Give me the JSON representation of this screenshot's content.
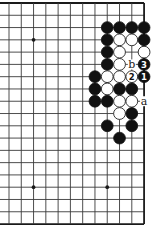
{
  "diagram": {
    "type": "go-board-fragment",
    "board_size": 19,
    "visible_columns": 12,
    "visible_rows": 19,
    "edges_visible": [
      "top",
      "right",
      "bottom"
    ],
    "star_points": [
      {
        "col": 2,
        "row": 3
      },
      {
        "col": 2,
        "row": 15
      },
      {
        "col": 8,
        "row": 15
      }
    ],
    "stones": [
      {
        "color": "black",
        "col": 8,
        "row": 2
      },
      {
        "color": "black",
        "col": 9,
        "row": 2
      },
      {
        "color": "black",
        "col": 10,
        "row": 2
      },
      {
        "color": "black",
        "col": 11,
        "row": 2
      },
      {
        "color": "black",
        "col": 8,
        "row": 3
      },
      {
        "color": "white",
        "col": 9,
        "row": 3
      },
      {
        "color": "white",
        "col": 10,
        "row": 3
      },
      {
        "color": "black",
        "col": 11,
        "row": 3
      },
      {
        "color": "black",
        "col": 8,
        "row": 4
      },
      {
        "color": "white",
        "col": 9,
        "row": 4
      },
      {
        "color": "white",
        "col": 11,
        "row": 4
      },
      {
        "color": "black",
        "col": 8,
        "row": 5
      },
      {
        "color": "white",
        "col": 9,
        "row": 5
      },
      {
        "color": "black",
        "col": 11,
        "row": 5,
        "label": "3"
      },
      {
        "color": "black",
        "col": 7,
        "row": 6
      },
      {
        "color": "white",
        "col": 8,
        "row": 6
      },
      {
        "color": "white",
        "col": 9,
        "row": 6
      },
      {
        "color": "white",
        "col": 10,
        "row": 6,
        "label": "2"
      },
      {
        "color": "black",
        "col": 11,
        "row": 6,
        "label": "1"
      },
      {
        "color": "black",
        "col": 7,
        "row": 7
      },
      {
        "color": "white",
        "col": 8,
        "row": 7
      },
      {
        "color": "black",
        "col": 9,
        "row": 7
      },
      {
        "color": "black",
        "col": 10,
        "row": 7
      },
      {
        "color": "black",
        "col": 7,
        "row": 8
      },
      {
        "color": "black",
        "col": 8,
        "row": 8
      },
      {
        "color": "white",
        "col": 9,
        "row": 8
      },
      {
        "color": "white",
        "col": 10,
        "row": 8
      },
      {
        "color": "white",
        "col": 9,
        "row": 9
      },
      {
        "color": "black",
        "col": 10,
        "row": 9
      },
      {
        "color": "black",
        "col": 8,
        "row": 10
      },
      {
        "color": "black",
        "col": 10,
        "row": 10
      },
      {
        "color": "black",
        "col": 9,
        "row": 11
      }
    ],
    "point_labels": [
      {
        "text": "b",
        "col": 10,
        "row": 5
      },
      {
        "text": "a",
        "col": 11,
        "row": 8
      }
    ],
    "colors": {
      "black_stone": "#111111",
      "white_stone": "#ffffff",
      "line": "#3a3a3a"
    }
  }
}
